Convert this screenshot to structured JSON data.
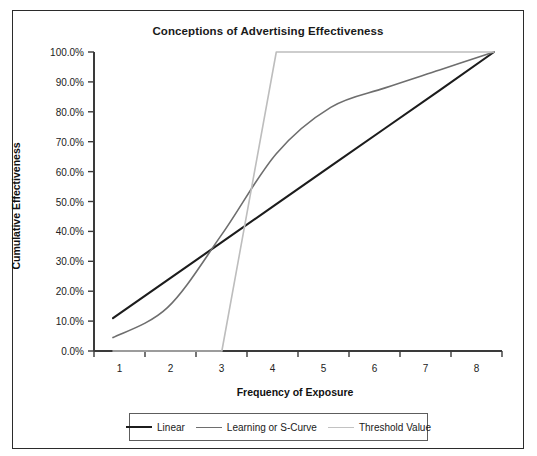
{
  "chart_data": {
    "type": "line",
    "title": "Conceptions of Advertising Effectiveness",
    "xlabel": "Frequency of Exposure",
    "ylabel": "Cumulative Effectiveness",
    "categories": [
      "1",
      "2",
      "3",
      "4",
      "5",
      "6",
      "7",
      "8"
    ],
    "x_tick_labels": [
      "1",
      "2",
      "3",
      "4",
      "5",
      "6",
      "7",
      "8"
    ],
    "y_tick_labels": [
      "0.0%",
      "10.0%",
      "20.0%",
      "30.0%",
      "40.0%",
      "50.0%",
      "60.0%",
      "70.0%",
      "80.0%",
      "90.0%",
      "100.0%"
    ],
    "y_tick_values": [
      0,
      10,
      20,
      30,
      40,
      50,
      60,
      70,
      80,
      90,
      100
    ],
    "ylim": [
      0,
      100
    ],
    "xlim": [
      1,
      8
    ],
    "grid": false,
    "legend_position": "bottom",
    "series": [
      {
        "name": "Linear",
        "color": "#1c1c1c",
        "line_width": 2.1,
        "x": [
          1,
          2,
          3,
          4,
          5,
          6,
          7,
          8
        ],
        "values": [
          11.0,
          23.7,
          36.4,
          49.1,
          61.8,
          74.5,
          87.2,
          100.0
        ]
      },
      {
        "name": "Learning or S-Curve",
        "color": "#6e6e6e",
        "line_width": 1.6,
        "x": [
          1,
          2,
          3,
          4,
          5,
          6,
          7,
          8
        ],
        "values": [
          4.5,
          14.5,
          39.0,
          66.0,
          81.5,
          88.0,
          94.0,
          100.0
        ]
      },
      {
        "name": "Threshold Value",
        "color": "#bdbdbd",
        "line_width": 1.6,
        "x": [
          1,
          2,
          3,
          4,
          5,
          6,
          7,
          8
        ],
        "values": [
          0.0,
          0.0,
          0.0,
          100.0,
          100.0,
          100.0,
          100.0,
          100.0
        ]
      }
    ]
  },
  "legend": {
    "items": [
      {
        "label": "Linear",
        "color": "#1c1c1c",
        "width": 2.4
      },
      {
        "label": "Learning or S-Curve",
        "color": "#6e6e6e",
        "width": 1.7
      },
      {
        "label": "Threshold Value",
        "color": "#c2c2c2",
        "width": 1.7
      }
    ]
  },
  "colors": {
    "frame": "#2b2b2b",
    "axis": "#3a3a3a",
    "linear": "#1c1c1c",
    "scurve": "#6e6e6e",
    "threshold": "#bdbdbd",
    "background": "#ffffff"
  }
}
